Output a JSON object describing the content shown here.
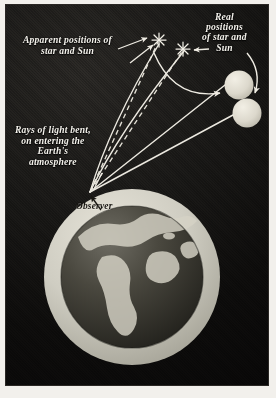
{
  "figure": {
    "frame": {
      "border_color": "#2a2724",
      "paper_color": "#f2f0ec",
      "sky_color": "#0e0d0c"
    }
  },
  "labels": {
    "apparent": "Apparent positions of\nstar and Sun",
    "real": "Real\npositions\nof star and\nSun",
    "rays": "Rays of light bent,\non entering the\nEarth's\natmosphere",
    "observer": "Observer"
  },
  "objects": {
    "earth": {
      "name": "Earth",
      "center_x": 131,
      "center_y": 275,
      "globe_radius": 71,
      "atmosphere_radius": 88,
      "globe_color": "#3b3a35",
      "atmosphere_color": "#cfcdc2"
    },
    "real_star": {
      "name": "Real position of star",
      "cx": 238,
      "cy": 84,
      "r": 14,
      "color": "#ddd9cd"
    },
    "real_sun": {
      "name": "Real position of Sun",
      "cx": 246,
      "cy": 112,
      "r": 14,
      "color": "#ddd9cd"
    },
    "apparent_star": {
      "name": "Apparent position of star",
      "cx": 158,
      "cy": 39,
      "marker": "asterisk"
    },
    "apparent_sun": {
      "name": "Apparent position of Sun",
      "cx": 182,
      "cy": 47,
      "marker": "asterisk"
    },
    "observer_point": {
      "name": "Observer on Earth's surface",
      "x": 89,
      "y": 191
    }
  },
  "lines": {
    "real_ray_style": "solid",
    "apparent_ray_style": "dashed",
    "ray_color": "#ece9e0",
    "dash_pattern": "5,4"
  },
  "annotations": {
    "refraction_arc": "curved arrow from apparent position toward real position",
    "real_label_arc": "curved arrow from Real positions label to the Sun disc",
    "apparent_arrow": "arrow from Apparent positions label to the apparent markers",
    "observer_arrow": "arrow from Observer label to the observer point"
  },
  "colors": {
    "ink_light": "#f4f2ec",
    "ink_dark": "#15130f",
    "sky": "#0e0d0c",
    "disc": "#ddd9cd"
  }
}
